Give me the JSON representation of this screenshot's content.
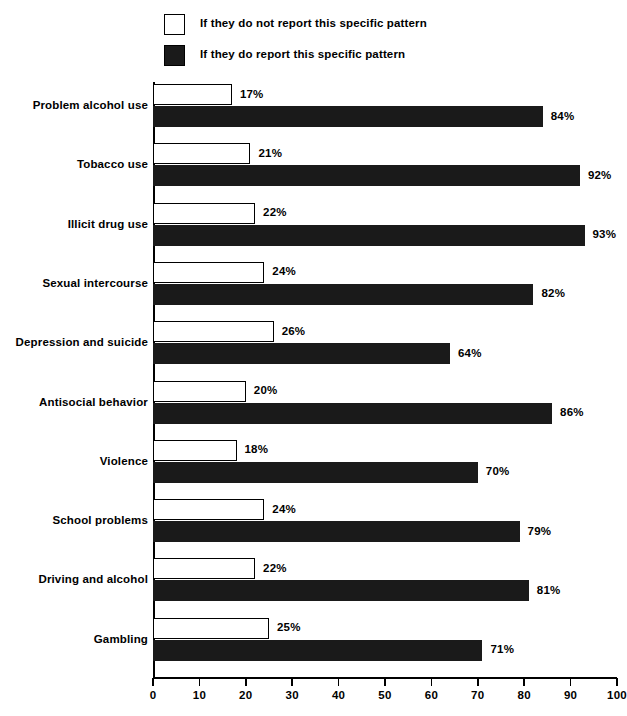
{
  "legend": {
    "items": [
      {
        "label": "If they do not report this specific pattern",
        "style": "open",
        "swatch_name": "legend-swatch-open"
      },
      {
        "label": "If they do report this specific pattern",
        "style": "filled",
        "swatch_name": "legend-swatch-filled"
      }
    ]
  },
  "axis": {
    "ticks": [
      "0",
      "10",
      "20",
      "30",
      "40",
      "50",
      "60",
      "70",
      "80",
      "90",
      "100"
    ]
  },
  "chart_data": {
    "type": "bar",
    "orientation": "horizontal",
    "title": "",
    "subtitle": "",
    "xlabel": "",
    "ylabel": "",
    "xlim": [
      0,
      100
    ],
    "xticks": [
      0,
      10,
      20,
      30,
      40,
      50,
      60,
      70,
      80,
      90,
      100
    ],
    "grid": false,
    "legend_position": "top",
    "colors": {
      "not_report": "#ffffff",
      "report": "#1a1a1a",
      "outline": "#000000"
    },
    "categories": [
      "Problem alcohol use",
      "Tobacco use",
      "Illicit drug use",
      "Sexual intercourse",
      "Depression and suicide",
      "Antisocial behavior",
      "Violence",
      "School problems",
      "Driving and alcohol",
      "Gambling"
    ],
    "series": [
      {
        "name": "If they do not report this specific pattern",
        "values": [
          17,
          21,
          22,
          24,
          26,
          20,
          18,
          24,
          22,
          25
        ],
        "labels": [
          "17%",
          "21%",
          "22%",
          "24%",
          "26%",
          "20%",
          "18%",
          "24%",
          "22%",
          "25%"
        ]
      },
      {
        "name": "If they do report this specific pattern",
        "values": [
          84,
          92,
          93,
          82,
          64,
          86,
          70,
          79,
          81,
          71
        ],
        "labels": [
          "84%",
          "92%",
          "93%",
          "82%",
          "64%",
          "86%",
          "70%",
          "79%",
          "81%",
          "71%"
        ]
      }
    ]
  }
}
